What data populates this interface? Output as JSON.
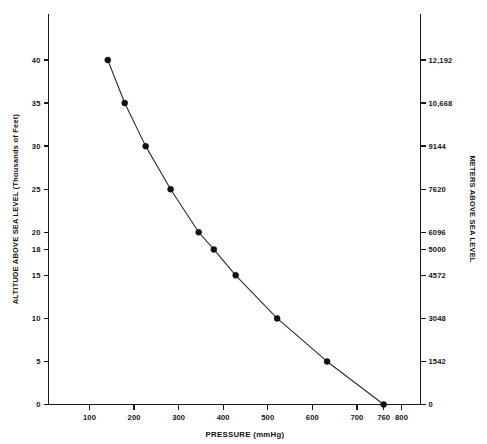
{
  "chart_data": {
    "type": "line",
    "title": "",
    "subtitle": "",
    "xlabel": "PRESSURE (mmHg)",
    "ylabel": "ALTITUDE ABOVE SEA LEVEL (Thousands of Feet)",
    "y2label": "METERS ABOVE SEA LEVEL",
    "xlim": [
      0,
      860
    ],
    "ylim": [
      0,
      44
    ],
    "grid": false,
    "legend": null,
    "legend_position": "none",
    "x_ticks": [
      {
        "value": 100,
        "label": "100"
      },
      {
        "value": 200,
        "label": "200"
      },
      {
        "value": 300,
        "label": "300"
      },
      {
        "value": 400,
        "label": "400"
      },
      {
        "value": 500,
        "label": "500"
      },
      {
        "value": 600,
        "label": "600"
      },
      {
        "value": 700,
        "label": "700"
      },
      {
        "value": 760,
        "label": "760"
      },
      {
        "value": 800,
        "label": "800"
      }
    ],
    "y_ticks": [
      {
        "value": 0,
        "label": "0"
      },
      {
        "value": 5,
        "label": "5"
      },
      {
        "value": 10,
        "label": "10"
      },
      {
        "value": 15,
        "label": "15"
      },
      {
        "value": 18,
        "label": "18"
      },
      {
        "value": 20,
        "label": "20"
      },
      {
        "value": 25,
        "label": "25"
      },
      {
        "value": 30,
        "label": "30"
      },
      {
        "value": 35,
        "label": "35"
      },
      {
        "value": 40,
        "label": "40"
      }
    ],
    "y2_ticks": [
      {
        "value": 0,
        "label": "0"
      },
      {
        "value": 5,
        "label": "1542"
      },
      {
        "value": 10,
        "label": "3048"
      },
      {
        "value": 15,
        "label": "4572"
      },
      {
        "value": 18,
        "label": "5000"
      },
      {
        "value": 20,
        "label": "6096"
      },
      {
        "value": 25,
        "label": "7620"
      },
      {
        "value": 30,
        "label": "9144"
      },
      {
        "value": 35,
        "label": "10,668"
      },
      {
        "value": 40,
        "label": "12,192"
      }
    ],
    "series": [
      {
        "name": "altitude-vs-pressure",
        "x": [
          760,
          633,
          521,
          428,
          379,
          345,
          282,
          226,
          179,
          141
        ],
        "y": [
          0,
          5,
          10,
          15,
          18,
          20,
          25,
          30,
          35,
          40
        ],
        "x_units": "mmHg",
        "y_units": "thousands of feet",
        "color": "#2b2b2b",
        "marker": "circle"
      }
    ]
  },
  "colors": {
    "background": "#ffffff",
    "axis": "#1a1a1a",
    "line": "#2b2b2b",
    "marker": "#111111",
    "text": "#161616"
  }
}
